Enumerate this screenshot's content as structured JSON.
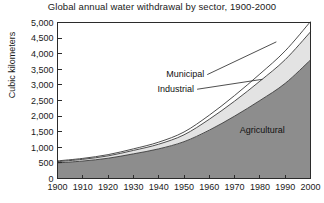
{
  "chart_data": {
    "type": "area",
    "title": "Global annual water withdrawal by sector, 1900-2000",
    "xlabel": "",
    "ylabel": "Cubic kilometers",
    "stacked": true,
    "grid": false,
    "legend_position": "inline-annotations",
    "xlim": [
      1900,
      2000
    ],
    "ylim": [
      0,
      5000
    ],
    "ytick_step": 500,
    "x": [
      1900,
      1910,
      1920,
      1930,
      1940,
      1950,
      1960,
      1970,
      1980,
      1990,
      2000
    ],
    "xticks": [
      "1900",
      "1910",
      "1920",
      "1930",
      "1940",
      "1950",
      "1960",
      "1970",
      "1980",
      "1990",
      "2000"
    ],
    "yticks": [
      "0",
      "500",
      "1,000",
      "1,500",
      "2,000",
      "2,500",
      "3,000",
      "3,500",
      "4,000",
      "4,500",
      "5,000"
    ],
    "series": [
      {
        "name": "Agricultural",
        "color": "#8d8d8d",
        "values": [
          500,
          560,
          650,
          790,
          950,
          1180,
          1550,
          2000,
          2500,
          3050,
          3800
        ]
      },
      {
        "name": "Industrial",
        "color": "#e3e3e3",
        "values": [
          40,
          55,
          75,
          110,
          150,
          220,
          350,
          480,
          620,
          760,
          900
        ]
      },
      {
        "name": "Municipal",
        "color": "#ffffff",
        "values": [
          25,
          30,
          40,
          50,
          65,
          90,
          130,
          180,
          230,
          280,
          330
        ]
      }
    ],
    "totals": [
      565,
      645,
      765,
      950,
      1165,
      1490,
      2030,
      2660,
      3350,
      4090,
      5030
    ],
    "annotations": [
      {
        "text": "Municipal",
        "x": 1958,
        "y": 3250
      },
      {
        "text": "Industrial",
        "x": 1954,
        "y": 2780
      },
      {
        "text": "Agricultural",
        "x": 1972,
        "y": 1450
      }
    ]
  }
}
